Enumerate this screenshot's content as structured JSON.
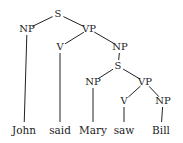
{
  "diagram": {
    "type": "syntax-tree",
    "sentence": "John said Mary saw Bill",
    "nodes": {
      "s_top": {
        "label": "S",
        "x": 58,
        "y": 14
      },
      "np_john": {
        "label": "NP",
        "x": 27,
        "y": 29
      },
      "vp_top": {
        "label": "VP",
        "x": 89,
        "y": 29
      },
      "v_said": {
        "label": "V",
        "x": 60,
        "y": 47
      },
      "np_obj": {
        "label": "NP",
        "x": 120,
        "y": 47
      },
      "s_low": {
        "label": "S",
        "x": 118,
        "y": 66
      },
      "np_mary": {
        "label": "NP",
        "x": 93,
        "y": 82
      },
      "vp_low": {
        "label": "VP",
        "x": 145,
        "y": 82
      },
      "v_saw": {
        "label": "V",
        "x": 124,
        "y": 101
      },
      "np_bill": {
        "label": "NP",
        "x": 163,
        "y": 101
      }
    },
    "leaves": {
      "john": {
        "label": "John",
        "x": 24,
        "y": 130
      },
      "said": {
        "label": "said",
        "x": 60,
        "y": 130
      },
      "mary": {
        "label": "Mary",
        "x": 93,
        "y": 130
      },
      "saw": {
        "label": "saw",
        "x": 124,
        "y": 130
      },
      "bill": {
        "label": "Bill",
        "x": 161,
        "y": 130
      }
    },
    "edges": [
      [
        "s_top",
        "np_john"
      ],
      [
        "s_top",
        "vp_top"
      ],
      [
        "vp_top",
        "v_said"
      ],
      [
        "vp_top",
        "np_obj"
      ],
      [
        "np_obj",
        "s_low"
      ],
      [
        "s_low",
        "np_mary"
      ],
      [
        "s_low",
        "vp_low"
      ],
      [
        "vp_low",
        "v_saw"
      ],
      [
        "vp_low",
        "np_bill"
      ],
      [
        "np_john",
        "john"
      ],
      [
        "v_said",
        "said"
      ],
      [
        "np_mary",
        "mary"
      ],
      [
        "v_saw",
        "saw"
      ],
      [
        "np_bill",
        "bill"
      ]
    ],
    "line_color": "#222222"
  }
}
